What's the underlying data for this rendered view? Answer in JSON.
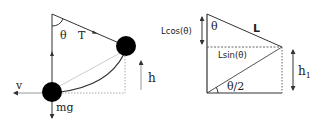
{
  "left_diagram": {
    "labels": {
      "theta": "θ",
      "tension": "T",
      "velocity": "v",
      "weight": "mg",
      "height": "h"
    }
  },
  "right_diagram": {
    "labels": {
      "adjacent": "Lcos(θ)",
      "theta": "θ",
      "hypotenuse": "L",
      "opposite": "Lsin(θ)",
      "half_angle": "θ/2",
      "height": "h",
      "height_sub": "1"
    }
  },
  "colors": {
    "line": "#333333",
    "ball": "#000000",
    "dotted": "#999999",
    "arc": "#333333"
  }
}
